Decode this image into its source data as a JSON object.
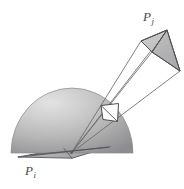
{
  "figure": {
    "title_visible": false,
    "background_color": "#ffffff",
    "labels": [
      {
        "id": "pj",
        "base": "P",
        "subscript": "j",
        "x": 143,
        "y": 10,
        "color": "#4a4a4a"
      },
      {
        "id": "pi",
        "base": "P",
        "subscript": "i",
        "x": 25,
        "y": 164,
        "color": "#4a4a4a"
      }
    ],
    "colors": {
      "outline": "#58585a",
      "hemisphere_light": "#d8d8d8",
      "hemisphere_mid": "#b4b4b4",
      "hemisphere_dark": "#8e8e90",
      "ground_fill": "#b0b0b0",
      "patch_fill": "#bfbfbf",
      "patch_fill_dark": "#a8a8a8",
      "projected_patch_fill": "#ffffff",
      "ray_line": "#6a6a6c"
    },
    "elements": {
      "hemisphere": {
        "cx": 72,
        "cy": 153,
        "rx": 61,
        "ry": 65
      },
      "ground_quad": [
        [
          18,
          157
        ],
        [
          62,
          149
        ],
        [
          109,
          147
        ],
        [
          70,
          158
        ]
      ],
      "projected_patch": [
        [
          101,
          106
        ],
        [
          118,
          104
        ],
        [
          117,
          121
        ],
        [
          103,
          119
        ]
      ],
      "far_patch": [
        [
          141,
          41
        ],
        [
          167,
          30
        ],
        [
          180,
          71
        ],
        [
          152,
          52
        ]
      ],
      "origin_point": [
        71,
        153
      ]
    }
  }
}
